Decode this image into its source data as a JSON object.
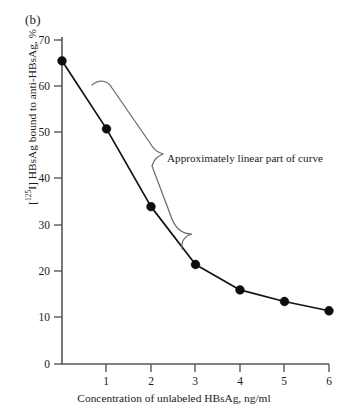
{
  "figure": {
    "panel_label": "(b)",
    "annotation": "Approximately linear part of curve"
  },
  "chart_data": {
    "type": "line",
    "title": "",
    "subtitle": "",
    "panel": "(b)",
    "xlabel": "Concentration of unlabeled HBsAg, ng/ml",
    "ylabel": "[125I] HBsAg bound to anti-HBsAg, %",
    "ylabel_prefix": "[",
    "ylabel_isotope": "125",
    "ylabel_suffix": "I] HBsAg bound to anti-HBsAg, %",
    "x": [
      0,
      1,
      2,
      3,
      4,
      5,
      6
    ],
    "values": [
      65.5,
      50.8,
      34.0,
      21.5,
      16.0,
      13.5,
      11.5
    ],
    "series": [
      {
        "name": "Bound labeled HBsAg",
        "x": [
          0,
          1,
          2,
          3,
          4,
          5,
          6
        ],
        "values": [
          65.5,
          50.8,
          34.0,
          21.5,
          16.0,
          13.5,
          11.5
        ]
      }
    ],
    "xlim": [
      0,
      6
    ],
    "ylim": [
      0,
      70
    ],
    "xticks": [
      0,
      1,
      2,
      3,
      4,
      5,
      6
    ],
    "yticks": [
      0,
      10,
      20,
      30,
      40,
      50,
      60,
      70
    ],
    "xtick_labels": [
      "0",
      "1",
      "2",
      "3",
      "4",
      "5",
      "6"
    ],
    "ytick_labels": [
      "0",
      "10",
      "20",
      "30",
      "40",
      "50",
      "60",
      "70"
    ],
    "grid": false,
    "legend": false,
    "legend_position": "none",
    "annotations": [
      {
        "text": "Approximately linear part of curve",
        "target_range_x": [
          0,
          3
        ],
        "style": "curly-brace"
      }
    ],
    "marker": "filled-circle",
    "line_color": "#121212",
    "marker_color": "#0d0d0d",
    "brace_color": "#6a6d70",
    "axis_color": "#55585a",
    "background": "#ffffff"
  }
}
